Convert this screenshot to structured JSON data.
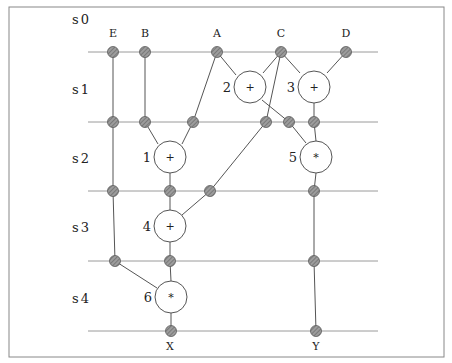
{
  "diagram": {
    "frame": {
      "x": 9,
      "y": 7,
      "w": 435,
      "h": 350
    },
    "colors": {
      "line": "#9a9a9a",
      "edge": "#555555",
      "register_fill": "#8a8a8a",
      "register_stroke": "#5a5a5a",
      "node_fill": "#ffffff",
      "node_stroke": "#555555",
      "text": "#222222"
    },
    "steps": [
      {
        "label": "s0",
        "x": 72,
        "y": 20
      },
      {
        "label": "s1",
        "x": 72,
        "y": 90
      },
      {
        "label": "s2",
        "x": 72,
        "y": 159
      },
      {
        "label": "s3",
        "x": 72,
        "y": 228
      },
      {
        "label": "s4",
        "x": 72,
        "y": 299
      }
    ],
    "step_lines": [
      {
        "y": 52,
        "x1": 88,
        "x2": 378
      },
      {
        "y": 122,
        "x1": 88,
        "x2": 378
      },
      {
        "y": 191,
        "x1": 88,
        "x2": 378
      },
      {
        "y": 261,
        "x1": 88,
        "x2": 378
      },
      {
        "y": 331,
        "x1": 88,
        "x2": 378
      }
    ],
    "inputs": [
      {
        "label": "E",
        "x": 113,
        "y": 37
      },
      {
        "label": "B",
        "x": 145,
        "y": 37
      },
      {
        "label": "A",
        "x": 217,
        "y": 37
      },
      {
        "label": "C",
        "x": 281,
        "y": 37
      },
      {
        "label": "D",
        "x": 346,
        "y": 37
      }
    ],
    "outputs": [
      {
        "label": "X",
        "x": 170,
        "y": 350
      },
      {
        "label": "Y",
        "x": 316,
        "y": 350
      }
    ],
    "operations": [
      {
        "id": "1",
        "op": "+",
        "x": 170,
        "y": 157
      },
      {
        "id": "2",
        "op": "+",
        "x": 250,
        "y": 87
      },
      {
        "id": "3",
        "op": "+",
        "x": 314,
        "y": 87
      },
      {
        "id": "4",
        "op": "+",
        "x": 170,
        "y": 226
      },
      {
        "id": "5",
        "op": "*",
        "x": 316,
        "y": 157
      },
      {
        "id": "6",
        "op": "*",
        "x": 171,
        "y": 297
      }
    ],
    "registers": [
      {
        "x": 113,
        "y": 52
      },
      {
        "x": 145,
        "y": 52
      },
      {
        "x": 217,
        "y": 52
      },
      {
        "x": 281,
        "y": 52
      },
      {
        "x": 346,
        "y": 52
      },
      {
        "x": 113,
        "y": 122
      },
      {
        "x": 145,
        "y": 122
      },
      {
        "x": 193,
        "y": 122
      },
      {
        "x": 266,
        "y": 122
      },
      {
        "x": 289,
        "y": 122
      },
      {
        "x": 314,
        "y": 122
      },
      {
        "x": 113,
        "y": 191
      },
      {
        "x": 170,
        "y": 191
      },
      {
        "x": 210,
        "y": 191
      },
      {
        "x": 314,
        "y": 191
      },
      {
        "x": 115,
        "y": 261
      },
      {
        "x": 170,
        "y": 261
      },
      {
        "x": 314,
        "y": 261
      },
      {
        "x": 171,
        "y": 331
      },
      {
        "x": 316,
        "y": 331
      }
    ],
    "edges": [
      {
        "x1": 113,
        "y1": 52,
        "x2": 113,
        "y2": 122
      },
      {
        "x1": 145,
        "y1": 52,
        "x2": 145,
        "y2": 122
      },
      {
        "x1": 217,
        "y1": 52,
        "x2": 193,
        "y2": 122
      },
      {
        "x1": 217,
        "y1": 52,
        "x2": 236,
        "y2": 75
      },
      {
        "x1": 281,
        "y1": 52,
        "x2": 263,
        "y2": 73
      },
      {
        "x1": 281,
        "y1": 52,
        "x2": 300,
        "y2": 73
      },
      {
        "x1": 281,
        "y1": 52,
        "x2": 266,
        "y2": 122
      },
      {
        "x1": 346,
        "y1": 52,
        "x2": 327,
        "y2": 73
      },
      {
        "x1": 262,
        "y1": 100,
        "x2": 289,
        "y2": 122
      },
      {
        "x1": 314,
        "y1": 103,
        "x2": 314,
        "y2": 122
      },
      {
        "x1": 113,
        "y1": 122,
        "x2": 113,
        "y2": 191
      },
      {
        "x1": 145,
        "y1": 122,
        "x2": 158,
        "y2": 144
      },
      {
        "x1": 193,
        "y1": 122,
        "x2": 182,
        "y2": 144
      },
      {
        "x1": 266,
        "y1": 122,
        "x2": 210,
        "y2": 191
      },
      {
        "x1": 289,
        "y1": 122,
        "x2": 306,
        "y2": 143
      },
      {
        "x1": 314,
        "y1": 122,
        "x2": 316,
        "y2": 141
      },
      {
        "x1": 170,
        "y1": 173,
        "x2": 170,
        "y2": 191
      },
      {
        "x1": 316,
        "y1": 173,
        "x2": 314,
        "y2": 191
      },
      {
        "x1": 113,
        "y1": 191,
        "x2": 115,
        "y2": 261
      },
      {
        "x1": 170,
        "y1": 191,
        "x2": 170,
        "y2": 210
      },
      {
        "x1": 210,
        "y1": 191,
        "x2": 182,
        "y2": 215
      },
      {
        "x1": 314,
        "y1": 191,
        "x2": 314,
        "y2": 261
      },
      {
        "x1": 170,
        "y1": 242,
        "x2": 170,
        "y2": 261
      },
      {
        "x1": 115,
        "y1": 261,
        "x2": 157,
        "y2": 288
      },
      {
        "x1": 170,
        "y1": 261,
        "x2": 171,
        "y2": 281
      },
      {
        "x1": 314,
        "y1": 261,
        "x2": 316,
        "y2": 331
      },
      {
        "x1": 171,
        "y1": 313,
        "x2": 171,
        "y2": 331
      }
    ]
  }
}
